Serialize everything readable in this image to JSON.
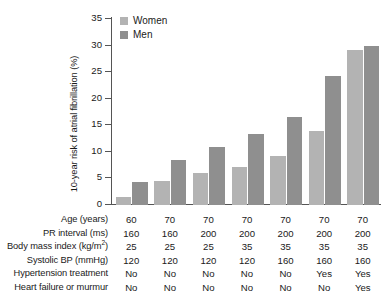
{
  "chart_data": {
    "type": "bar",
    "title": "",
    "xlabel": "",
    "ylabel": "10-year risk of atrial fibrillation (%)",
    "ylim": [
      0,
      35
    ],
    "yticks": [
      0,
      5,
      10,
      15,
      20,
      25,
      30,
      35
    ],
    "ytick_labels": [
      "0",
      "5",
      "10",
      "15",
      "20",
      "25",
      "30",
      "35"
    ],
    "grid": false,
    "legend_position": "top-left",
    "categories": [
      "1",
      "2",
      "3",
      "4",
      "5",
      "6",
      "7"
    ],
    "series": [
      {
        "name": "Women",
        "color": "#b3b3b3",
        "values": [
          1.5,
          4.6,
          6.0,
          7.2,
          9.3,
          14.0,
          29.2
        ]
      },
      {
        "name": "Men",
        "color": "#8f8f8f",
        "values": [
          4.3,
          8.4,
          11.0,
          13.3,
          16.6,
          24.3,
          30.0
        ]
      }
    ]
  },
  "legend": {
    "items": [
      {
        "label": "Women",
        "color": "#b3b3b3"
      },
      {
        "label": "Men",
        "color": "#8f8f8f"
      }
    ]
  },
  "risk_table": {
    "rows": [
      {
        "label": "Age (years)",
        "label_html": "Age (years)",
        "values": [
          "60",
          "70",
          "70",
          "70",
          "70",
          "70",
          "70"
        ]
      },
      {
        "label": "PR interval (ms)",
        "label_html": "PR interval (ms)",
        "values": [
          "160",
          "160",
          "200",
          "200",
          "200",
          "200",
          "200"
        ]
      },
      {
        "label": "Body mass index (kg/m2)",
        "label_html": "Body mass index (kg/m<sup>2</sup>)",
        "values": [
          "25",
          "25",
          "25",
          "35",
          "35",
          "35",
          "35"
        ]
      },
      {
        "label": "Systolic BP (mmHg)",
        "label_html": "Systolic BP (mmHg)",
        "values": [
          "120",
          "120",
          "120",
          "120",
          "160",
          "160",
          "160"
        ]
      },
      {
        "label": "Hypertension treatment",
        "label_html": "Hypertension treatment",
        "values": [
          "No",
          "No",
          "No",
          "No",
          "No",
          "Yes",
          "Yes"
        ]
      },
      {
        "label": "Heart failure or murmur",
        "label_html": "Heart failure or murmur",
        "values": [
          "No",
          "No",
          "No",
          "No",
          "No",
          "No",
          "Yes"
        ]
      }
    ]
  },
  "colors": {
    "women_bar": "#b3b3b3",
    "men_bar": "#8f8f8f",
    "axis": "#555555",
    "text": "#1a1a1a",
    "background": "#ffffff"
  }
}
